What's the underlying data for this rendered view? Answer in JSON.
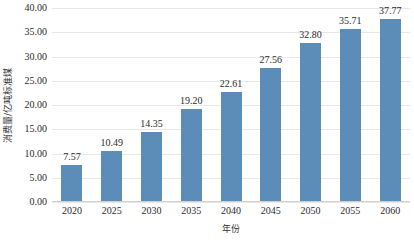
{
  "chart_data": {
    "type": "bar",
    "title": "",
    "subtitle": "",
    "xlabel": "年份",
    "ylabel": "消费量/亿吨标准煤",
    "categories": [
      "2020",
      "2025",
      "2030",
      "2035",
      "2040",
      "2045",
      "2050",
      "2055",
      "2060"
    ],
    "values": [
      7.57,
      10.49,
      14.35,
      19.2,
      22.61,
      27.56,
      32.8,
      35.71,
      37.77
    ],
    "data_labels": [
      "7.57",
      "10.49",
      "14.35",
      "19.20",
      "22.61",
      "27.56",
      "32.80",
      "35.71",
      "37.77"
    ],
    "ylim": [
      0,
      40
    ],
    "ytick_step": 5,
    "ytick_labels": [
      "40.00",
      "35.00",
      "30.00",
      "25.00",
      "20.00",
      "15.00",
      "10.00",
      "5.00",
      "0.00"
    ],
    "ytick_values": [
      40,
      35,
      30,
      25,
      20,
      15,
      10,
      5,
      0
    ],
    "grid": true,
    "grid_axis": "y",
    "legend": false,
    "legend_position": "none",
    "series": [
      {
        "name": "消费量",
        "values": [
          7.57,
          10.49,
          14.35,
          19.2,
          22.61,
          27.56,
          32.8,
          35.71,
          37.77
        ]
      }
    ],
    "colors": {
      "bar": "#5b8db8",
      "grid": "#e8e8e8",
      "axis": "#d0d0d0",
      "text": "#2b2b2b",
      "background": "#ffffff"
    }
  }
}
